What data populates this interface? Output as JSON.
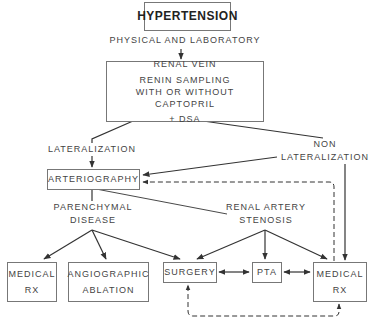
{
  "nodes": {
    "hypertension": "HYPERTENSION",
    "physical_lab": "PHYSICAL AND LABORATORY",
    "renal_vein": [
      "RENAL VEIN",
      "RENIN SAMPLING",
      "WITH OR WITHOUT CAPTOPRIL",
      "+ DSA"
    ],
    "lateralization": "LATERALIZATION",
    "non_lateralization": [
      "NON",
      "LATERALIZATION"
    ],
    "arteriography": "ARTERIOGRAPHY",
    "parenchymal": [
      "PARENCHYMAL",
      "DISEASE"
    ],
    "renal_artery": [
      "RENAL ARTERY",
      "STENOSIS"
    ],
    "medical_rx_left": [
      "MEDICAL",
      "RX"
    ],
    "angiographic": [
      "ANGIOGRAPHIC",
      "ABLATION"
    ],
    "surgery": "SURGERY",
    "pta": "PTA",
    "medical_rx_right": [
      "MEDICAL",
      "RX"
    ]
  },
  "edges": [
    {
      "from": "hypertension",
      "to": "renal_vein",
      "style": "solid"
    },
    {
      "from": "renal_vein",
      "to": "lateralization",
      "style": "solid"
    },
    {
      "from": "renal_vein",
      "to": "non_lateralization",
      "style": "solid"
    },
    {
      "from": "lateralization",
      "to": "arteriography",
      "style": "solid"
    },
    {
      "from": "non_lateralization",
      "to": "arteriography",
      "style": "solid"
    },
    {
      "from": "non_lateralization",
      "to": "medical_rx_right",
      "style": "solid"
    },
    {
      "from": "medical_rx_right",
      "to": "arteriography",
      "style": "dashed"
    },
    {
      "from": "arteriography",
      "to": "parenchymal",
      "style": "solid"
    },
    {
      "from": "arteriography",
      "to": "renal_artery",
      "style": "solid"
    },
    {
      "from": "parenchymal",
      "to": "medical_rx_left",
      "style": "solid"
    },
    {
      "from": "parenchymal",
      "to": "angiographic",
      "style": "solid"
    },
    {
      "from": "parenchymal",
      "to": "surgery",
      "style": "solid"
    },
    {
      "from": "renal_artery",
      "to": "surgery",
      "style": "solid"
    },
    {
      "from": "renal_artery",
      "to": "pta",
      "style": "solid"
    },
    {
      "from": "renal_artery",
      "to": "medical_rx_right",
      "style": "solid"
    },
    {
      "from": "surgery",
      "to": "pta",
      "style": "solid-bidirectional"
    },
    {
      "from": "pta",
      "to": "medical_rx_right",
      "style": "solid-bidirectional"
    },
    {
      "from": "medical_rx_right",
      "to": "surgery",
      "style": "dashed-bidirectional"
    }
  ]
}
